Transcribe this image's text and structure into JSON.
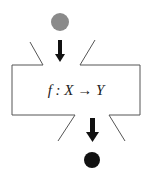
{
  "diagram": {
    "function_label": "f : X → Y",
    "input_node": {
      "shape": "circle",
      "color": "#8a8a8a"
    },
    "output_node": {
      "shape": "circle",
      "color": "#111111"
    },
    "box": {
      "border_color": "#555555"
    },
    "arrows": [
      {
        "from": "input_node",
        "to": "box",
        "direction": "down"
      },
      {
        "from": "box",
        "to": "output_node",
        "direction": "down"
      }
    ]
  }
}
